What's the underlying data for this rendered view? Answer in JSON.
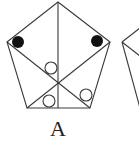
{
  "figure": {
    "label": "A",
    "stroke_color": "#3a3a3a",
    "fill_color": "#111111",
    "pentagon": {
      "vertices": [
        [
          58,
          2
        ],
        [
          110,
          42
        ],
        [
          90,
          108
        ],
        [
          27,
          108
        ],
        [
          7,
          42
        ]
      ],
      "center": [
        58,
        83
      ]
    },
    "filled_dots": [
      {
        "cx": 18,
        "cy": 42,
        "r": 6
      },
      {
        "cx": 97,
        "cy": 41,
        "r": 6
      }
    ],
    "open_circles": [
      {
        "cx": 51,
        "cy": 68,
        "r": 6
      },
      {
        "cx": 49,
        "cy": 101,
        "r": 6
      },
      {
        "cx": 86,
        "cy": 95,
        "r": 6
      }
    ]
  },
  "partial_figure": {
    "description": "edge of adjacent pentagon (cut off)"
  }
}
